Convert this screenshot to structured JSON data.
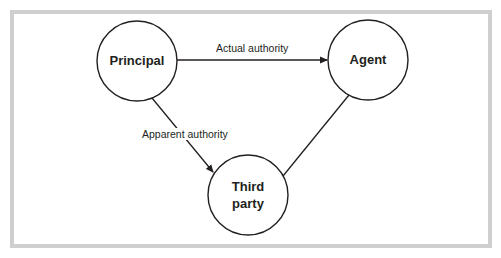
{
  "diagram": {
    "type": "relationship-triangle",
    "colors": {
      "frame": "#cfcfcf",
      "stroke": "#231f20",
      "background": "#ffffff"
    },
    "nodes": [
      {
        "id": "principal",
        "label": "Principal",
        "cx": 137,
        "cy": 61,
        "r": 40
      },
      {
        "id": "agent",
        "label": "Agent",
        "cx": 368,
        "cy": 60,
        "r": 40
      },
      {
        "id": "third_party",
        "label_line1": "Third",
        "label_line2": "party",
        "cx": 248,
        "cy": 195,
        "r": 40
      }
    ],
    "edges": [
      {
        "from": "principal",
        "to": "agent",
        "label": "Actual authority",
        "arrow": "end"
      },
      {
        "from": "principal",
        "to": "third_party",
        "label": "Apparent authority",
        "arrow": "end"
      },
      {
        "from": "agent",
        "to": "third_party",
        "label": "",
        "arrow": "none"
      }
    ]
  }
}
